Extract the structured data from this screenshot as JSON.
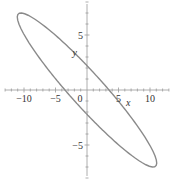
{
  "chart_data": {
    "type": "line",
    "title": "",
    "equation_estimate": "x^2 + 3xy + 2.5y^2 = 12.25",
    "xlabel": "x",
    "ylabel": "y",
    "xlim": [
      -13,
      13
    ],
    "ylim": [
      -8,
      8
    ],
    "grid": false,
    "legend": null,
    "x_ticks": [
      -10,
      -5,
      0,
      5,
      10
    ],
    "x_tick_labels": [
      "−10",
      "−5",
      "0",
      "5",
      "10"
    ],
    "y_ticks": [
      -5,
      5
    ],
    "y_tick_labels": [
      "−5",
      "5"
    ],
    "series": [
      {
        "name": "ellipse",
        "color": "#8a8a8a",
        "coeffs": {
          "a": 1,
          "b": 3,
          "c": 2.5,
          "rhs": 12.25
        },
        "key_points": [
          {
            "x": -3.5,
            "y": 0
          },
          {
            "x": 3.5,
            "y": 0
          },
          {
            "x": 0,
            "y": 2.2
          },
          {
            "x": 0,
            "y": -2.2
          },
          {
            "x": -12,
            "y": 7.5
          },
          {
            "x": 12,
            "y": -7.5
          }
        ]
      }
    ]
  },
  "layout": {
    "origin_px": [
      87,
      90
    ],
    "px_per_unit_x": 6.3,
    "px_per_unit_y": 11,
    "axis_color": "#9a9a9a",
    "curve_color": "#8a8a8a"
  }
}
